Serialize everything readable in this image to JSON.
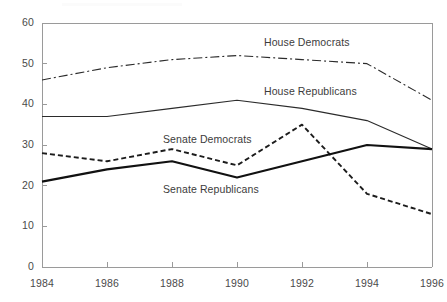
{
  "chart_data": {
    "type": "line",
    "title": "",
    "subtitle": "",
    "xlabel": "",
    "ylabel": "",
    "x": [
      1984,
      1986,
      1988,
      1990,
      1992,
      1994,
      1996
    ],
    "xtick_labels": [
      "1984",
      "1986",
      "1988",
      "1990",
      "1992",
      "1994",
      "1996"
    ],
    "ytick_labels": [
      "0",
      "10",
      "20",
      "30",
      "40",
      "50",
      "60"
    ],
    "ytick_values": [
      0,
      10,
      20,
      30,
      40,
      50,
      60
    ],
    "ylim": [
      0,
      60
    ],
    "xlim": [
      1984,
      1996
    ],
    "grid": false,
    "legend_position": "inline-annotations",
    "series": [
      {
        "name": "House Democrats",
        "values": [
          46,
          49,
          51,
          52,
          51,
          50,
          41
        ],
        "line_style": "dash-dot",
        "color": "#2b2b2b",
        "width": 1.1,
        "label_x": 264,
        "label_y": 36
      },
      {
        "name": "House Republicans",
        "values": [
          37,
          37,
          39,
          41,
          39,
          36,
          29
        ],
        "line_style": "solid",
        "color": "#2b2b2b",
        "width": 1.1,
        "label_x": 264,
        "label_y": 85
      },
      {
        "name": "Senate Democrats",
        "values": [
          28,
          26,
          29,
          25,
          35,
          18,
          13
        ],
        "line_style": "dashed",
        "color": "#1c1c1c",
        "width": 1.9,
        "label_x": 163,
        "label_y": 133
      },
      {
        "name": "Senate Republicans",
        "values": [
          21,
          24,
          26,
          22,
          26,
          30,
          29
        ],
        "line_style": "solid",
        "color": "#111111",
        "width": 2.2,
        "label_x": 163,
        "label_y": 183
      }
    ]
  },
  "axis": {
    "y_axis_name": "y-axis",
    "x_axis_name": "x-axis"
  }
}
